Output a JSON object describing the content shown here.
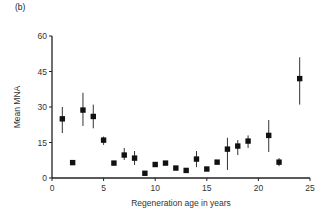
{
  "panel_label": "(b)",
  "chart_data": {
    "type": "scatter",
    "title": "",
    "panel": "(b)",
    "xlabel": "Regeneration age in years",
    "ylabel": "Mean MNA",
    "xlim": [
      0,
      25
    ],
    "ylim": [
      0,
      60
    ],
    "xticks": [
      0,
      5,
      10,
      15,
      20,
      25
    ],
    "yticks": [
      0,
      15,
      30,
      45,
      60
    ],
    "grid": false,
    "legend": null,
    "error_bars": true,
    "series": [
      {
        "name": "Mean MNA",
        "marker": "square",
        "color": "#111111",
        "points": [
          {
            "x": 1,
            "y": 25,
            "err_low": 19,
            "err_high": 30
          },
          {
            "x": 2,
            "y": 6.5,
            "err_low": 6.5,
            "err_high": 6.5
          },
          {
            "x": 3,
            "y": 28.7,
            "err_low": 22,
            "err_high": 36
          },
          {
            "x": 4,
            "y": 26,
            "err_low": 21,
            "err_high": 31
          },
          {
            "x": 5,
            "y": 16,
            "err_low": 14,
            "err_high": 17.5
          },
          {
            "x": 6,
            "y": 6.3,
            "err_low": 6.3,
            "err_high": 6.3
          },
          {
            "x": 7,
            "y": 9.7,
            "err_low": 7.6,
            "err_high": 12.7
          },
          {
            "x": 8,
            "y": 8.4,
            "err_low": 5.5,
            "err_high": 11.4
          },
          {
            "x": 9,
            "y": 2,
            "err_low": 2,
            "err_high": 2
          },
          {
            "x": 10,
            "y": 5.7,
            "err_low": 5.7,
            "err_high": 5.7
          },
          {
            "x": 11,
            "y": 6.3,
            "err_low": 6.3,
            "err_high": 6.3
          },
          {
            "x": 12,
            "y": 4.2,
            "err_low": 4.2,
            "err_high": 4.2
          },
          {
            "x": 13,
            "y": 3.2,
            "err_low": 3.2,
            "err_high": 3.2
          },
          {
            "x": 14,
            "y": 8,
            "err_low": 4.6,
            "err_high": 11.4
          },
          {
            "x": 15,
            "y": 3.8,
            "err_low": 3.8,
            "err_high": 3.8
          },
          {
            "x": 16,
            "y": 6.7,
            "err_low": 6.7,
            "err_high": 6.7
          },
          {
            "x": 17,
            "y": 12.2,
            "err_low": 3.4,
            "err_high": 17
          },
          {
            "x": 18,
            "y": 13.5,
            "err_low": 9.7,
            "err_high": 16
          },
          {
            "x": 19,
            "y": 15.6,
            "err_low": 12.7,
            "err_high": 18
          },
          {
            "x": 21,
            "y": 18,
            "err_low": 11,
            "err_high": 24.5
          },
          {
            "x": 22,
            "y": 6.7,
            "err_low": 5,
            "err_high": 8.4
          },
          {
            "x": 24,
            "y": 42,
            "err_low": 31,
            "err_high": 51
          }
        ]
      }
    ]
  }
}
